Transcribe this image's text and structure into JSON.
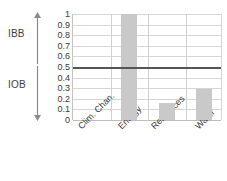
{
  "chart_data": {
    "type": "bar",
    "title": "",
    "xlabel": "",
    "ylabel": "",
    "categories": [
      "Clim. Chan.",
      "Energy",
      "Resources",
      "Water"
    ],
    "values": [
      0,
      1.0,
      0.16,
      0.29
    ],
    "series": [
      {
        "name": "index",
        "values": [
          0,
          1.0,
          0.16,
          0.29
        ]
      }
    ],
    "ylim": [
      0,
      1
    ],
    "ytick_labels": [
      "1",
      "0.9",
      "0.8",
      "0.7",
      "0.6",
      "0.5",
      "0.4",
      "0.3",
      "0.2",
      "0.1",
      "0"
    ],
    "ytick_values": [
      1,
      0.9,
      0.8,
      0.7,
      0.6,
      0.5,
      0.4,
      0.3,
      0.2,
      0.1,
      0
    ],
    "grid": true,
    "legend": "none",
    "bar_color": "#c9c9c9",
    "grid_color": "#d6d6d6",
    "threshold": {
      "value": 0.5,
      "color": "#555555",
      "label": ""
    },
    "annotations": [
      {
        "name": "IBB",
        "label": "IBB",
        "range": [
          0.5,
          1.0
        ],
        "arrow": "up"
      },
      {
        "name": "IOB",
        "label": "IOB",
        "range": [
          0.0,
          0.5
        ],
        "arrow": "down"
      }
    ]
  }
}
